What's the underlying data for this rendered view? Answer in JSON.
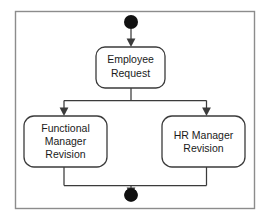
{
  "diagram": {
    "type": "uml-activity-diagram",
    "title": "",
    "frame": {
      "x": 15,
      "y": 11,
      "width": 240,
      "height": 198
    },
    "colors": {
      "background": "#ffffff",
      "frame_stroke": "#8c8c8c",
      "node_stroke": "#3b3b3b",
      "node_fill": "#ffffff",
      "text": "#1a1a1a",
      "control_node": "#111111"
    },
    "nodes": [
      {
        "id": "initial",
        "name": "initial-node",
        "kind": "initial",
        "label": "",
        "cx": 131,
        "cy": 22,
        "r": 7
      },
      {
        "id": "employee-request",
        "name": "employee-request",
        "kind": "action",
        "label": "Employee Request",
        "lines": [
          "Employee",
          "Request"
        ],
        "x": 96,
        "y": 47,
        "width": 69,
        "height": 41
      },
      {
        "id": "functional-manager-revision",
        "name": "functional-manager-revision",
        "kind": "action",
        "label": "Functional Manager Revision",
        "lines": [
          "Functional",
          "Manager",
          "Revision"
        ],
        "x": 24,
        "y": 116,
        "width": 83,
        "height": 51
      },
      {
        "id": "hr-manager-revision",
        "name": "hr-manager-revision",
        "kind": "action",
        "label": "HR Manager Revision",
        "lines": [
          "HR Manager",
          "Revision"
        ],
        "x": 162,
        "y": 116,
        "width": 83,
        "height": 51
      },
      {
        "id": "final",
        "name": "final-node",
        "kind": "final",
        "label": "",
        "cx": 131,
        "cy": 195,
        "r": 6.5
      }
    ],
    "edges": [
      {
        "id": "e1",
        "name": "flow-initial-to-employee-request",
        "from": "initial",
        "to": "employee-request",
        "label": ""
      },
      {
        "id": "e2",
        "name": "flow-employee-request-to-functional-manager-revision",
        "from": "employee-request",
        "to": "functional-manager-revision",
        "label": ""
      },
      {
        "id": "e3",
        "name": "flow-employee-request-to-hr-manager-revision",
        "from": "employee-request",
        "to": "hr-manager-revision",
        "label": ""
      },
      {
        "id": "e4",
        "name": "flow-functional-manager-revision-to-final",
        "from": "functional-manager-revision",
        "to": "final",
        "label": ""
      },
      {
        "id": "e5",
        "name": "flow-hr-manager-revision-to-final",
        "from": "hr-manager-revision",
        "to": "final",
        "label": ""
      }
    ],
    "text": {
      "employee_request_line1": "Employee",
      "employee_request_line2": "Request",
      "functional_line1": "Functional",
      "functional_line2": "Manager",
      "functional_line3": "Revision",
      "hr_line1": "HR Manager",
      "hr_line2": "Revision"
    }
  }
}
